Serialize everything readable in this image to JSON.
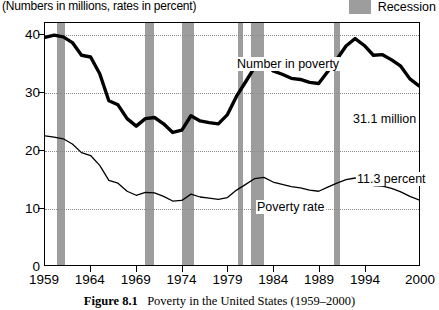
{
  "subtitle": "(Numbers in millions, rates in percent)",
  "legend": {
    "label": "Recession",
    "swatch_color": "#9d9d9d"
  },
  "caption": {
    "figure_number": "Figure 8.1",
    "text": "Poverty in the United States (1959–2000)"
  },
  "annotations": {
    "number_in_poverty": "Number in poverty",
    "poverty_rate": "Poverty rate",
    "last_number": "31.1 million",
    "last_rate": "11.3 percent"
  },
  "chart_data": {
    "type": "line",
    "title": "Poverty in the United States (1959–2000)",
    "subtitle": "(Numbers in millions, rates in percent)",
    "xlabel": "",
    "ylabel": "",
    "xlim": [
      1959,
      2000
    ],
    "ylim": [
      0,
      42
    ],
    "yticks": [
      0,
      10,
      20,
      30,
      40
    ],
    "xticks": [
      1959,
      1964,
      1969,
      1974,
      1979,
      1984,
      1989,
      1994,
      2000
    ],
    "grid": "horizontal-dotted",
    "legend_position": "top-right",
    "x": [
      1959,
      1960,
      1961,
      1962,
      1963,
      1964,
      1965,
      1966,
      1967,
      1968,
      1969,
      1970,
      1971,
      1972,
      1973,
      1974,
      1975,
      1976,
      1977,
      1978,
      1979,
      1980,
      1981,
      1982,
      1983,
      1984,
      1985,
      1986,
      1987,
      1988,
      1989,
      1990,
      1991,
      1992,
      1993,
      1994,
      1995,
      1996,
      1997,
      1998,
      1999,
      2000
    ],
    "series": [
      {
        "name": "Number in poverty",
        "unit": "millions",
        "style": "thick-black-line",
        "values": [
          39.5,
          39.9,
          39.6,
          38.6,
          36.4,
          36.1,
          33.2,
          28.5,
          27.8,
          25.4,
          24.1,
          25.4,
          25.6,
          24.5,
          23.0,
          23.4,
          25.9,
          25.0,
          24.7,
          24.5,
          26.1,
          29.3,
          31.8,
          34.4,
          35.3,
          33.7,
          33.1,
          32.4,
          32.2,
          31.7,
          31.5,
          33.6,
          35.7,
          38.0,
          39.3,
          38.1,
          36.4,
          36.5,
          35.6,
          34.5,
          32.3,
          31.1
        ]
      },
      {
        "name": "Poverty rate",
        "unit": "percent",
        "style": "thin-black-line",
        "values": [
          22.4,
          22.2,
          21.9,
          21.0,
          19.5,
          19.0,
          17.3,
          14.7,
          14.2,
          12.8,
          12.1,
          12.6,
          12.5,
          11.9,
          11.1,
          11.2,
          12.3,
          11.8,
          11.6,
          11.4,
          11.7,
          13.0,
          14.0,
          15.0,
          15.2,
          14.4,
          14.0,
          13.6,
          13.4,
          13.0,
          12.8,
          13.5,
          14.2,
          14.8,
          15.1,
          14.5,
          13.8,
          13.7,
          13.3,
          12.7,
          11.9,
          11.3
        ]
      }
    ],
    "recessions": [
      {
        "start": 1960.3,
        "end": 1961.2
      },
      {
        "start": 1969.9,
        "end": 1970.9
      },
      {
        "start": 1973.9,
        "end": 1975.2
      },
      {
        "start": 1980.0,
        "end": 1980.6
      },
      {
        "start": 1981.5,
        "end": 1982.9
      },
      {
        "start": 1990.5,
        "end": 1991.2
      }
    ],
    "endpoint_labels": {
      "number_in_poverty": "31.1 million",
      "poverty_rate": "11.3 percent"
    }
  }
}
